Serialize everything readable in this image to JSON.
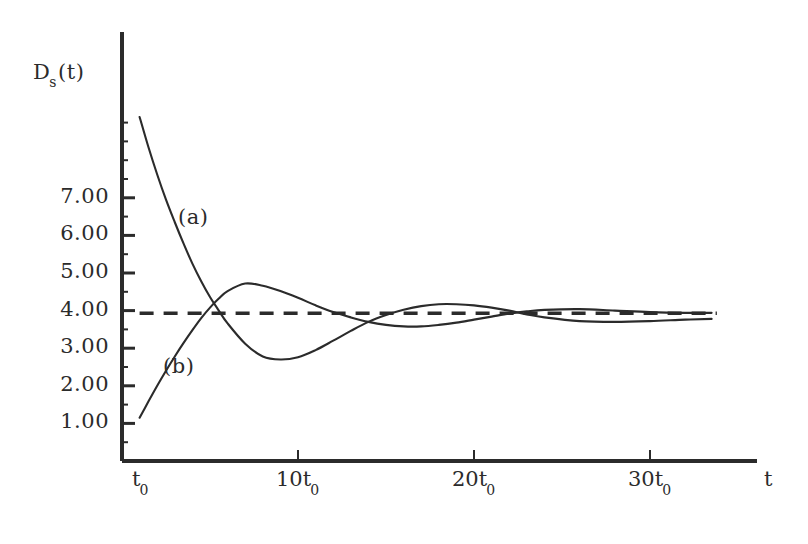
{
  "figure": {
    "background_color": "#ffffff",
    "ink_color": "#2b2b2b"
  },
  "axes": {
    "y_axis_title_main": "D",
    "y_axis_title_sub": "s",
    "y_axis_title_tail": "(t)",
    "x_axis_title": "t",
    "y_tick_labels": [
      "7.00",
      "6.00",
      "5.00",
      "4.00",
      "3.00",
      "2.00",
      "1.00"
    ],
    "x_tick_labels": [
      {
        "main": "t",
        "sub": "0"
      },
      {
        "main": "10t",
        "sub": "0"
      },
      {
        "main": "20t",
        "sub": "0"
      },
      {
        "main": "30t",
        "sub": "0"
      }
    ]
  },
  "annotations": {
    "curve_a_label": "(a)",
    "curve_b_label": "(b)"
  },
  "chart_data": {
    "type": "line",
    "title": "",
    "subtitle": "",
    "xlabel": "t",
    "ylabel": "D_s(t)",
    "xlim": [
      0,
      34
    ],
    "ylim": [
      0,
      9.6
    ],
    "grid": false,
    "legend": "inline-annotations",
    "x_unit": "t_0",
    "x_tick_values": [
      1,
      10,
      20,
      30
    ],
    "x_tick_text": [
      "t_0",
      "10t_0",
      "20t_0",
      "30t_0"
    ],
    "y_tick_values": [
      1,
      2,
      3,
      4,
      5,
      6,
      7
    ],
    "y_tick_text": [
      "1.00",
      "2.00",
      "3.00",
      "4.00",
      "5.00",
      "6.00",
      "7.00"
    ],
    "minor_y_ticks": true,
    "asymptote": {
      "name": "steady-state",
      "style": "dashed",
      "value": 3.93,
      "x_start": 1,
      "y_label": ""
    },
    "series": [
      {
        "name": "(a)",
        "style": "solid",
        "label_position": {
          "x": 3.6,
          "y": 5.35
        },
        "x": [
          1.0,
          1.5,
          2.0,
          2.5,
          3.0,
          3.5,
          4.0,
          4.5,
          5.0,
          5.5,
          6.0,
          7.0,
          8.0,
          9.0,
          10.0,
          11.0,
          12.0,
          13.0,
          14.0,
          15.0,
          16.0,
          17.0,
          18.0,
          19.0,
          20.0,
          21.0,
          22.0,
          23.0,
          24.0,
          26.0,
          28.0,
          30.0,
          32.0,
          33.5
        ],
        "y": [
          9.15,
          8.35,
          7.62,
          6.95,
          6.35,
          5.78,
          5.25,
          4.78,
          4.36,
          4.0,
          3.66,
          3.12,
          2.78,
          2.7,
          2.76,
          2.95,
          3.2,
          3.46,
          3.7,
          3.88,
          4.02,
          4.12,
          4.17,
          4.17,
          4.14,
          4.08,
          4.0,
          3.9,
          3.82,
          3.72,
          3.7,
          3.72,
          3.76,
          3.78
        ]
      },
      {
        "name": "(b)",
        "style": "solid",
        "label_position": {
          "x": 2.7,
          "y": 2.25
        },
        "x": [
          1.0,
          1.5,
          2.0,
          2.5,
          3.0,
          3.5,
          4.0,
          4.5,
          5.0,
          5.5,
          6.0,
          7.0,
          8.0,
          9.0,
          10.0,
          11.0,
          12.0,
          13.0,
          14.0,
          15.0,
          16.0,
          17.0,
          18.0,
          19.0,
          20.0,
          21.0,
          22.0,
          23.0,
          24.0,
          26.0,
          28.0,
          30.0,
          32.0,
          33.5
        ],
        "y": [
          1.15,
          1.58,
          2.0,
          2.4,
          2.78,
          3.14,
          3.48,
          3.8,
          4.08,
          4.32,
          4.52,
          4.72,
          4.66,
          4.52,
          4.34,
          4.14,
          3.96,
          3.82,
          3.7,
          3.62,
          3.58,
          3.58,
          3.62,
          3.68,
          3.76,
          3.84,
          3.92,
          3.98,
          4.02,
          4.04,
          4.0,
          3.96,
          3.94,
          3.94
        ]
      }
    ]
  }
}
